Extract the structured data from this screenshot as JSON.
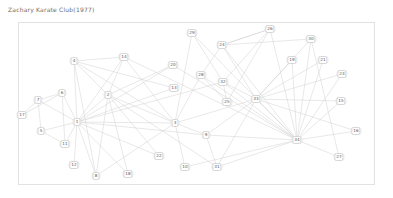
{
  "figure": {
    "title": "Zachary Karate Club(1977)",
    "title_color": "#6e6e6e",
    "border_color": "#e2e2e2",
    "background": "#ffffff"
  },
  "chart_data": {
    "type": "network",
    "title": "Zachary Karate Club(1977)",
    "xlabel": "",
    "ylabel": "",
    "grid": false,
    "legend": null,
    "node_count": 34,
    "edge_count": 78,
    "node_style": {
      "shape": "rounded-rect",
      "fill": "#ffffff",
      "stroke": "#d6d6d6",
      "label_color": "#555555"
    },
    "edge_style": {
      "stroke": "#d0d0d0",
      "width": 0.5
    },
    "nodes": [
      {
        "id": "1",
        "label": "1",
        "x": 77,
        "y": 122
      },
      {
        "id": "2",
        "label": "2",
        "x": 108,
        "y": 95
      },
      {
        "id": "3",
        "label": "3",
        "x": 175,
        "y": 123
      },
      {
        "id": "4",
        "label": "4",
        "x": 74,
        "y": 61
      },
      {
        "id": "5",
        "label": "5",
        "x": 41,
        "y": 131
      },
      {
        "id": "6",
        "label": "6",
        "x": 62,
        "y": 93
      },
      {
        "id": "7",
        "label": "7",
        "x": 38,
        "y": 100
      },
      {
        "id": "8",
        "label": "8",
        "x": 96,
        "y": 176
      },
      {
        "id": "9",
        "label": "9",
        "x": 206,
        "y": 135
      },
      {
        "id": "10",
        "label": "10",
        "x": 185,
        "y": 167
      },
      {
        "id": "11",
        "label": "11",
        "x": 65,
        "y": 144
      },
      {
        "id": "12",
        "label": "12",
        "x": 74,
        "y": 165
      },
      {
        "id": "13",
        "label": "13",
        "x": 174,
        "y": 88
      },
      {
        "id": "14",
        "label": "14",
        "x": 124,
        "y": 57
      },
      {
        "id": "15",
        "label": "15",
        "x": 341,
        "y": 101
      },
      {
        "id": "16",
        "label": "16",
        "x": 356,
        "y": 131
      },
      {
        "id": "17",
        "label": "17",
        "x": 22,
        "y": 115
      },
      {
        "id": "18",
        "label": "18",
        "x": 128,
        "y": 174
      },
      {
        "id": "19",
        "label": "19",
        "x": 292,
        "y": 60
      },
      {
        "id": "20",
        "label": "20",
        "x": 173,
        "y": 65
      },
      {
        "id": "21",
        "label": "21",
        "x": 323,
        "y": 60
      },
      {
        "id": "22",
        "label": "22",
        "x": 159,
        "y": 156
      },
      {
        "id": "23",
        "label": "23",
        "x": 342,
        "y": 74
      },
      {
        "id": "24",
        "label": "24",
        "x": 222,
        "y": 45
      },
      {
        "id": "25",
        "label": "25",
        "x": 227,
        "y": 102
      },
      {
        "id": "26",
        "label": "26",
        "x": 270,
        "y": 29
      },
      {
        "id": "27",
        "label": "27",
        "x": 339,
        "y": 157
      },
      {
        "id": "28",
        "label": "28",
        "x": 201,
        "y": 75
      },
      {
        "id": "29",
        "label": "29",
        "x": 192,
        "y": 33
      },
      {
        "id": "30",
        "label": "30",
        "x": 311,
        "y": 39
      },
      {
        "id": "31",
        "label": "31",
        "x": 217,
        "y": 167
      },
      {
        "id": "32",
        "label": "32",
        "x": 223,
        "y": 82
      },
      {
        "id": "33",
        "label": "33",
        "x": 256,
        "y": 99
      },
      {
        "id": "34",
        "label": "34",
        "x": 297,
        "y": 140
      }
    ],
    "edges": [
      [
        "1",
        "2"
      ],
      [
        "1",
        "3"
      ],
      [
        "1",
        "4"
      ],
      [
        "1",
        "5"
      ],
      [
        "1",
        "6"
      ],
      [
        "1",
        "7"
      ],
      [
        "1",
        "8"
      ],
      [
        "1",
        "9"
      ],
      [
        "1",
        "11"
      ],
      [
        "1",
        "12"
      ],
      [
        "1",
        "13"
      ],
      [
        "1",
        "14"
      ],
      [
        "1",
        "18"
      ],
      [
        "1",
        "20"
      ],
      [
        "1",
        "22"
      ],
      [
        "1",
        "32"
      ],
      [
        "2",
        "3"
      ],
      [
        "2",
        "4"
      ],
      [
        "2",
        "8"
      ],
      [
        "2",
        "14"
      ],
      [
        "2",
        "18"
      ],
      [
        "2",
        "20"
      ],
      [
        "2",
        "22"
      ],
      [
        "2",
        "31"
      ],
      [
        "3",
        "4"
      ],
      [
        "3",
        "8"
      ],
      [
        "3",
        "9"
      ],
      [
        "3",
        "10"
      ],
      [
        "3",
        "14"
      ],
      [
        "3",
        "28"
      ],
      [
        "3",
        "29"
      ],
      [
        "3",
        "33"
      ],
      [
        "4",
        "8"
      ],
      [
        "4",
        "13"
      ],
      [
        "4",
        "14"
      ],
      [
        "5",
        "7"
      ],
      [
        "5",
        "11"
      ],
      [
        "6",
        "7"
      ],
      [
        "6",
        "11"
      ],
      [
        "6",
        "17"
      ],
      [
        "7",
        "17"
      ],
      [
        "9",
        "31"
      ],
      [
        "9",
        "33"
      ],
      [
        "9",
        "34"
      ],
      [
        "10",
        "34"
      ],
      [
        "14",
        "34"
      ],
      [
        "15",
        "33"
      ],
      [
        "15",
        "34"
      ],
      [
        "16",
        "33"
      ],
      [
        "16",
        "34"
      ],
      [
        "19",
        "33"
      ],
      [
        "19",
        "34"
      ],
      [
        "20",
        "34"
      ],
      [
        "21",
        "33"
      ],
      [
        "21",
        "34"
      ],
      [
        "23",
        "33"
      ],
      [
        "23",
        "34"
      ],
      [
        "24",
        "26"
      ],
      [
        "24",
        "28"
      ],
      [
        "24",
        "30"
      ],
      [
        "24",
        "33"
      ],
      [
        "24",
        "34"
      ],
      [
        "25",
        "26"
      ],
      [
        "25",
        "28"
      ],
      [
        "25",
        "32"
      ],
      [
        "26",
        "24"
      ],
      [
        "26",
        "32"
      ],
      [
        "26",
        "34"
      ],
      [
        "27",
        "30"
      ],
      [
        "27",
        "34"
      ],
      [
        "28",
        "34"
      ],
      [
        "29",
        "32"
      ],
      [
        "29",
        "34"
      ],
      [
        "30",
        "33"
      ],
      [
        "30",
        "34"
      ],
      [
        "31",
        "33"
      ],
      [
        "31",
        "34"
      ],
      [
        "32",
        "33"
      ],
      [
        "32",
        "34"
      ],
      [
        "33",
        "34"
      ]
    ]
  }
}
